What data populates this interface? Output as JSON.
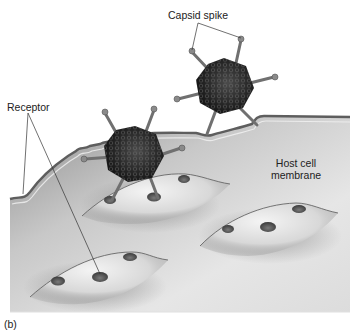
{
  "figure": {
    "panel_label": "(b)",
    "labels": {
      "capsid_spike": "Capsid spike",
      "receptor": "Receptor",
      "host_cell_membrane_line1": "Host cell",
      "host_cell_membrane_line2": "membrane"
    },
    "elements": {
      "virus_count": 2,
      "receptor_mound_count": 3,
      "receptors_per_mound": 3
    },
    "colors": {
      "membrane_fill_light": "#e9e9e9",
      "membrane_fill_dark": "#9a9a9a",
      "virus_body": "#1f1f1f",
      "spike": "#6e6e6e",
      "leader_line": "#333333"
    }
  }
}
